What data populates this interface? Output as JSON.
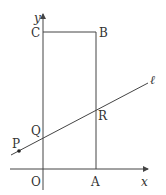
{
  "diagram": {
    "type": "coordinate-geometry",
    "colors": {
      "stroke": "#444444",
      "text": "#333333",
      "background": "#ffffff"
    },
    "axes": {
      "x_label": "x",
      "y_label": "y",
      "origin_label": "O"
    },
    "points": {
      "O": "O",
      "A": "A",
      "B": "B",
      "C": "C",
      "P": "P",
      "Q": "Q",
      "R": "R"
    },
    "line_label": "ℓ",
    "rectangle": [
      "O",
      "A",
      "B",
      "C"
    ]
  }
}
